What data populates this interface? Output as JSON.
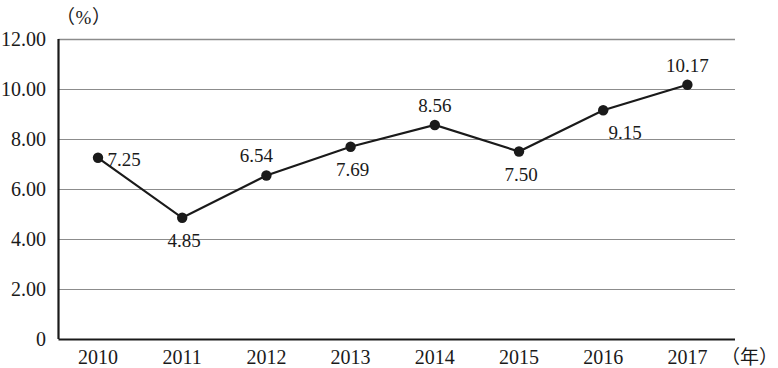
{
  "chart_data": {
    "type": "line",
    "title": "",
    "xlabel": "（年）",
    "ylabel": "（%）",
    "categories": [
      "2010",
      "2011",
      "2012",
      "2013",
      "2014",
      "2015",
      "2016",
      "2017"
    ],
    "values": [
      7.25,
      4.85,
      6.54,
      7.69,
      8.56,
      7.5,
      9.15,
      10.17
    ],
    "value_labels": [
      "7.25",
      "4.85",
      "6.54",
      "7.69",
      "8.56",
      "7.50",
      "9.15",
      "10.17"
    ],
    "label_positions": [
      "right",
      "below",
      "above-left",
      "below",
      "above",
      "below",
      "below-right",
      "above"
    ],
    "ylim": [
      0,
      12
    ],
    "ytick_labels": [
      "0",
      "2.00",
      "4.00",
      "6.00",
      "8.00",
      "10.00",
      "12.00"
    ],
    "ytick_values": [
      0,
      2,
      4,
      6,
      8,
      10,
      12
    ],
    "grid": true,
    "legend": "none",
    "series_color": "#1a1a1a",
    "grid_color": "#8c8c8c",
    "axis_color": "#1a1a1a",
    "marker": "filled-circle"
  }
}
